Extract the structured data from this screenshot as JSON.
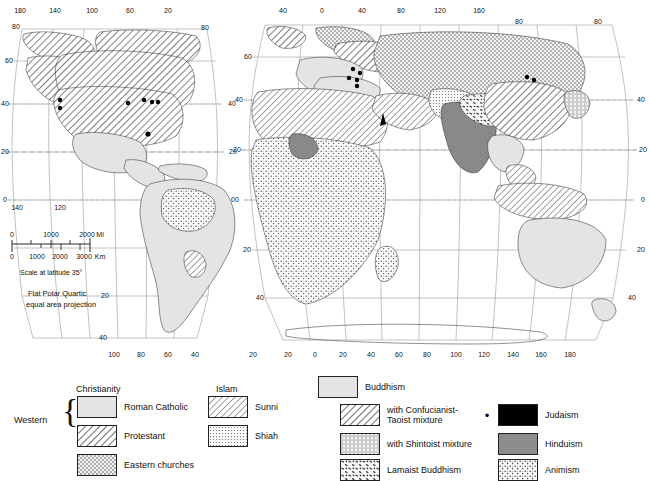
{
  "projection": {
    "line1": "Flat Polar Quartic",
    "line2": "equal area projection"
  },
  "scale": {
    "caption": "Scale at latitude 35°",
    "miles_unit": "Ml",
    "km_unit": "Km",
    "miles_ticks": [
      "0",
      "1000",
      "2000"
    ],
    "km_ticks": [
      "0",
      "1000",
      "2000",
      "3000"
    ]
  },
  "west_map": {
    "top_longitudes": [
      "180",
      "140",
      "100",
      "60",
      "20"
    ],
    "bottom_longitudes": [
      "140",
      "120",
      "100",
      "80",
      "60",
      "40"
    ],
    "left_latitudes": [
      "60",
      "40",
      "20",
      "0"
    ],
    "corner_latitudes": [
      "80",
      "80"
    ],
    "right_latitudes": [
      "40",
      "20",
      "0",
      "20",
      "40"
    ]
  },
  "east_map": {
    "top_longitudes": [
      "40",
      "0",
      "40",
      "80",
      "120",
      "160"
    ],
    "bottom_longitudes": [
      "20",
      "20",
      "0",
      "20",
      "40",
      "60",
      "80",
      "100",
      "120",
      "140",
      "160",
      "180"
    ],
    "left_latitudes": [
      "60",
      "40",
      "20",
      "0",
      "20",
      "40"
    ],
    "right_latitudes": [
      "40",
      "20",
      "0",
      "20",
      "40"
    ],
    "corner_latitude": "80"
  },
  "legend": {
    "western_label": "Western",
    "christianity": {
      "heading": "Christianity",
      "items": [
        {
          "label": "Roman Catholic",
          "pattern": "light-solid"
        },
        {
          "label": "Protestant",
          "pattern": "diagonal-hatch"
        },
        {
          "label": "Eastern churches",
          "pattern": "stipple"
        }
      ]
    },
    "islam": {
      "heading": "Islam",
      "items": [
        {
          "label": "Sunni",
          "pattern": "diagonal-hatch-wide"
        },
        {
          "label": "Shiah",
          "pattern": "fine-dot"
        }
      ]
    },
    "buddhism": {
      "items": [
        {
          "label": "Buddhism",
          "pattern": "light-solid"
        },
        {
          "label": "with Confucianist-\nTaoist mixture",
          "pattern": "diagonal-hatch"
        },
        {
          "label": "with Shintoist mixture",
          "pattern": "vertical-stipple"
        },
        {
          "label": "Lamaist Buddhism",
          "pattern": "dash-speckle"
        }
      ]
    },
    "other": {
      "items": [
        {
          "label": "Judaism",
          "pattern": "solid-black",
          "marker": "•"
        },
        {
          "label": "Hinduism",
          "pattern": "dark-gray"
        },
        {
          "label": "Animism",
          "pattern": "crosshatch-dot"
        }
      ]
    }
  },
  "colors": {
    "background": "#ffffff",
    "ink": "#111111",
    "roman_catholic": "#e2e2e2",
    "hinduism": "#8f8f8f",
    "judaism": "#000000",
    "graticule": "#9a9a9a",
    "coast": "#333333"
  }
}
